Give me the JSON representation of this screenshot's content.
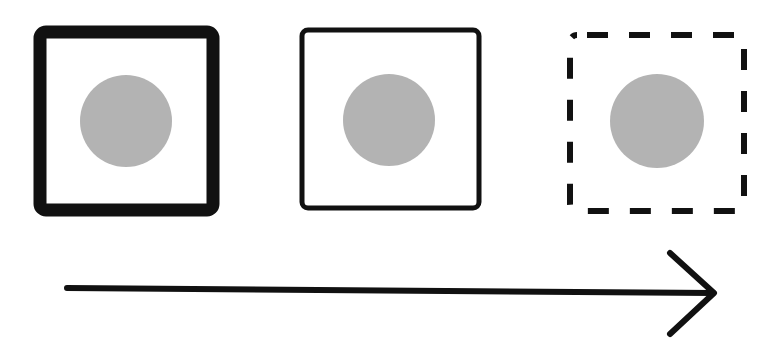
{
  "diagram": {
    "colors": {
      "stroke": "#111111",
      "circle": "#b3b3b3",
      "background": "#ffffff"
    },
    "boxes": [
      {
        "style": "thick-solid",
        "stroke_width": 13
      },
      {
        "style": "thin-solid",
        "stroke_width": 5
      },
      {
        "style": "dashed",
        "stroke_width": 6
      }
    ],
    "arrow": {
      "direction": "right"
    }
  }
}
